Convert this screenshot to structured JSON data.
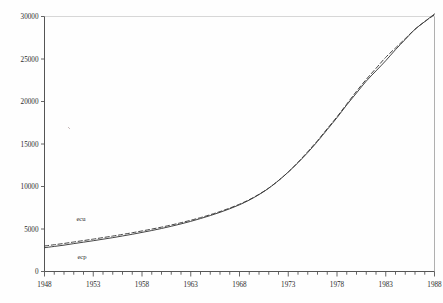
{
  "figure": {
    "background": "#fefefe",
    "ink_color": "#3a3a3a",
    "axis_color": "#555555",
    "label_color": "#2b2b2b"
  },
  "series_labels": {
    "upper": "ecu",
    "lower": "ecp"
  },
  "chart_data": {
    "type": "line",
    "title": "",
    "xlabel": "",
    "ylabel": "",
    "xlim": [
      1948,
      1988
    ],
    "ylim": [
      0,
      30000
    ],
    "grid": false,
    "legend_position": "inline-annotation",
    "yticks": [
      0,
      5000,
      10000,
      15000,
      20000,
      25000,
      30000
    ],
    "ytick_labels": [
      "0",
      "5000",
      "10000",
      "15000",
      "20000",
      "25000",
      "30000"
    ],
    "xticks": [
      1948,
      1953,
      1958,
      1963,
      1968,
      1973,
      1978,
      1983,
      1988
    ],
    "xtick_labels": [
      "1948",
      "1953",
      "1958",
      "1963",
      "1968",
      "1973",
      "1978",
      "1983",
      "1988"
    ],
    "x_minor_tick_interval": 1,
    "x": [
      1948,
      1949,
      1950,
      1951,
      1952,
      1953,
      1954,
      1955,
      1956,
      1957,
      1958,
      1959,
      1960,
      1961,
      1962,
      1963,
      1964,
      1965,
      1966,
      1967,
      1968,
      1969,
      1970,
      1971,
      1972,
      1973,
      1974,
      1975,
      1976,
      1977,
      1978,
      1979,
      1980,
      1981,
      1982,
      1983,
      1984,
      1985,
      1986,
      1987,
      1988
    ],
    "series": [
      {
        "name": "ecu",
        "style": "solid",
        "values": [
          2800,
          2950,
          3100,
          3280,
          3450,
          3620,
          3800,
          3980,
          4180,
          4380,
          4600,
          4820,
          5060,
          5320,
          5600,
          5900,
          6230,
          6580,
          6960,
          7380,
          7850,
          8400,
          9050,
          9800,
          10700,
          11700,
          12800,
          14000,
          15300,
          16700,
          18100,
          19600,
          21000,
          22400,
          23600,
          24800,
          26100,
          27300,
          28500,
          29400,
          30300
        ]
      },
      {
        "name": "ecp",
        "style": "dashed",
        "values": [
          3000,
          3150,
          3300,
          3470,
          3640,
          3810,
          3990,
          4170,
          4360,
          4560,
          4770,
          4990,
          5220,
          5470,
          5740,
          6030,
          6340,
          6680,
          7050,
          7460,
          7920,
          8450,
          9080,
          9820,
          10700,
          11700,
          12850,
          14100,
          15400,
          16800,
          18200,
          19700,
          21200,
          22600,
          23900,
          25200,
          26300,
          27400,
          28500,
          29400,
          30200
        ]
      }
    ]
  }
}
